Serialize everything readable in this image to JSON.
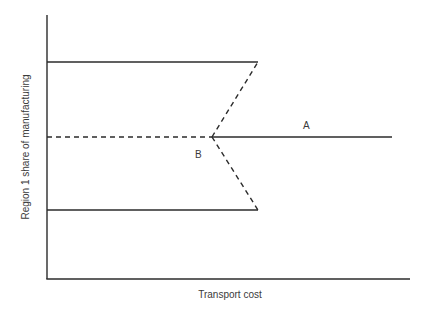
{
  "figure": {
    "type": "bifurcation-diagram",
    "xlabel": "Transport cost",
    "ylabel": "Region 1 share of manufacturing",
    "point_labels": {
      "A": "A",
      "B": "B"
    },
    "colors": {
      "line": "#2b2b2b",
      "text": "#3a3a3a",
      "background": "#ffffff"
    },
    "lines": [
      {
        "name": "upper-stable-branch",
        "style": "solid",
        "from": [
          47,
          62
        ],
        "to": [
          258,
          62
        ]
      },
      {
        "name": "lower-stable-branch",
        "style": "solid",
        "from": [
          47,
          210
        ],
        "to": [
          258,
          210
        ]
      },
      {
        "name": "symmetric-unstable-branch",
        "style": "dashed",
        "from": [
          47,
          137
        ],
        "to": [
          212,
          137
        ]
      },
      {
        "name": "symmetric-stable-branch",
        "style": "solid",
        "from": [
          212,
          137
        ],
        "to": [
          392,
          137
        ]
      },
      {
        "name": "upper-unstable-branch",
        "style": "dashed",
        "from": [
          212,
          137
        ],
        "to": [
          258,
          62
        ]
      },
      {
        "name": "lower-unstable-branch",
        "style": "dashed",
        "from": [
          212,
          137
        ],
        "to": [
          258,
          210
        ]
      }
    ]
  }
}
